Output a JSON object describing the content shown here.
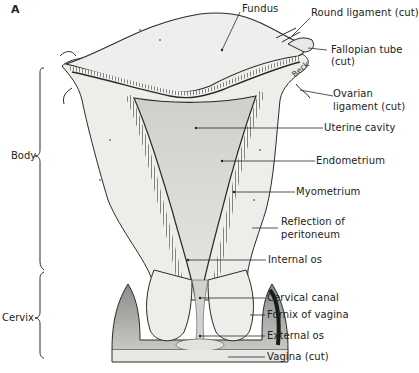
{
  "figure": {
    "panel_label": "A",
    "colors": {
      "line": "#2a2a2a",
      "tissue": "#ededea",
      "cavity": "#d8d8d4",
      "shadow": "#9a9a96"
    }
  },
  "regions": [
    {
      "name": "body",
      "label": "Body"
    },
    {
      "name": "cervix",
      "label": "Cervix"
    }
  ],
  "labels": [
    {
      "id": "fundus",
      "text": "Fundus"
    },
    {
      "id": "round-ligament",
      "text": "Round ligament (cut)"
    },
    {
      "id": "fallopian-tube",
      "text": "Fallopian tube"
    },
    {
      "id": "fallopian-tube-cut",
      "text": "(cut)"
    },
    {
      "id": "ovarian-ligament",
      "text": "Ovarian"
    },
    {
      "id": "ovarian-ligament-cut",
      "text": "ligament (cut)"
    },
    {
      "id": "uterine-cavity",
      "text": "Uterine cavity"
    },
    {
      "id": "endometrium",
      "text": "Endometrium"
    },
    {
      "id": "myometrium",
      "text": "Myometrium"
    },
    {
      "id": "reflection-peritoneum",
      "text": "Reflection of"
    },
    {
      "id": "reflection-peritoneum-2",
      "text": "peritoneum"
    },
    {
      "id": "internal-os",
      "text": "Internal os"
    },
    {
      "id": "cervical-canal",
      "text": "Cervical canal"
    },
    {
      "id": "fornix-vagina",
      "text": "Fornix of vagina"
    },
    {
      "id": "external-os",
      "text": "External os"
    },
    {
      "id": "vagina",
      "text": "Vagina (cut)"
    }
  ],
  "signature": "Beck"
}
